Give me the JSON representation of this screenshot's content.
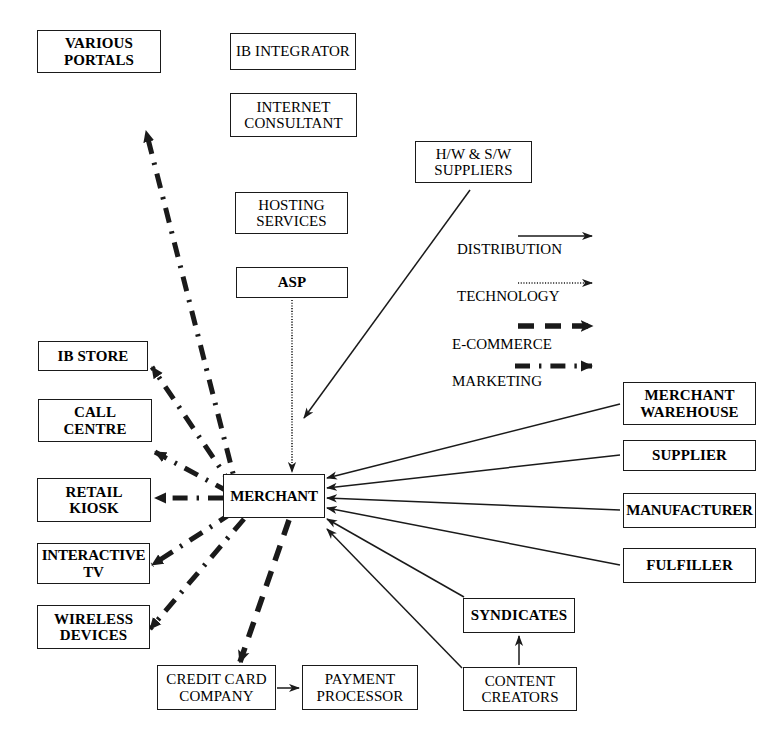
{
  "diagram": {
    "canvas": {
      "width": 782,
      "height": 738
    },
    "colors": {
      "line": "#1a1a1a",
      "box_border": "#1a1a1a",
      "background": "#ffffff",
      "text": "#000000"
    }
  },
  "nodes": [
    {
      "id": "various-portals",
      "label": "VARIOUS\nPORTALS",
      "x": 37,
      "y": 30,
      "w": 124,
      "h": 43,
      "bold": true
    },
    {
      "id": "ib-integrator",
      "label": "IB INTEGRATOR",
      "x": 230,
      "y": 33,
      "w": 126,
      "h": 37,
      "bold": false
    },
    {
      "id": "internet-consultant",
      "label": "INTERNET\nCONSULTANT",
      "x": 230,
      "y": 93,
      "w": 127,
      "h": 44,
      "bold": false
    },
    {
      "id": "hw-sw-suppliers",
      "label": "H/W & S/W\nSUPPLIERS",
      "x": 415,
      "y": 141,
      "w": 117,
      "h": 42,
      "bold": false
    },
    {
      "id": "hosting-services",
      "label": "HOSTING\nSERVICES",
      "x": 235,
      "y": 192,
      "w": 113,
      "h": 42,
      "bold": false
    },
    {
      "id": "asp",
      "label": "ASP",
      "x": 236,
      "y": 267,
      "w": 112,
      "h": 31,
      "bold": true
    },
    {
      "id": "ib-store",
      "label": "IB STORE",
      "x": 38,
      "y": 341,
      "w": 110,
      "h": 30,
      "bold": true
    },
    {
      "id": "call-centre",
      "label": "CALL\nCENTRE",
      "x": 38,
      "y": 399,
      "w": 114,
      "h": 43,
      "bold": true
    },
    {
      "id": "retail-kiosk",
      "label": "RETAIL\nKIOSK",
      "x": 37,
      "y": 478,
      "w": 114,
      "h": 44,
      "bold": true
    },
    {
      "id": "interactive-tv",
      "label": "INTERACTIVE\nTV",
      "x": 37,
      "y": 543,
      "w": 113,
      "h": 41,
      "bold": true
    },
    {
      "id": "wireless-devices",
      "label": "WIRELESS\nDEVICES",
      "x": 37,
      "y": 605,
      "w": 113,
      "h": 44,
      "bold": true
    },
    {
      "id": "merchant",
      "label": "MERCHANT",
      "x": 223,
      "y": 474,
      "w": 102,
      "h": 44,
      "bold": true
    },
    {
      "id": "merchant-warehouse",
      "label": "MERCHANT\nWAREHOUSE",
      "x": 623,
      "y": 382,
      "w": 133,
      "h": 43,
      "bold": true
    },
    {
      "id": "supplier",
      "label": "SUPPLIER",
      "x": 623,
      "y": 440,
      "w": 133,
      "h": 31,
      "bold": true
    },
    {
      "id": "manufacturer",
      "label": "MANUFACTURER",
      "x": 623,
      "y": 493,
      "w": 133,
      "h": 35,
      "bold": true
    },
    {
      "id": "fulfiller",
      "label": "FULFILLER",
      "x": 623,
      "y": 548,
      "w": 133,
      "h": 35,
      "bold": true
    },
    {
      "id": "syndicates",
      "label": "SYNDICATES",
      "x": 463,
      "y": 598,
      "w": 112,
      "h": 35,
      "bold": true
    },
    {
      "id": "content-creators",
      "label": "CONTENT\nCREATORS",
      "x": 463,
      "y": 667,
      "w": 114,
      "h": 44,
      "bold": false
    },
    {
      "id": "credit-card-company",
      "label": "CREDIT CARD\nCOMPANY",
      "x": 157,
      "y": 665,
      "w": 119,
      "h": 45,
      "bold": false
    },
    {
      "id": "payment-processor",
      "label": "PAYMENT\nPROCESSOR",
      "x": 302,
      "y": 665,
      "w": 116,
      "h": 45,
      "bold": false
    }
  ],
  "legend": {
    "items": [
      {
        "id": "distribution",
        "label": "DISTRIBUTION",
        "style": "solid",
        "label_x": 457,
        "label_y": 241,
        "arrow_x1": 518,
        "arrow_x2": 592,
        "arrow_y": 236
      },
      {
        "id": "technology",
        "label": "TECHNOLOGY",
        "style": "dotted",
        "label_x": 457,
        "label_y": 288,
        "arrow_x1": 518,
        "arrow_x2": 592,
        "arrow_y": 283
      },
      {
        "id": "e-commerce",
        "label": "E-COMMERCE",
        "style": "dashed",
        "label_x": 452,
        "label_y": 336,
        "arrow_x1": 518,
        "arrow_x2": 592,
        "arrow_y": 326
      },
      {
        "id": "marketing",
        "label": "MARKETING",
        "style": "dashdot",
        "label_x": 452,
        "label_y": 373,
        "arrow_x1": 515,
        "arrow_x2": 592,
        "arrow_y": 366
      }
    ]
  },
  "edges": [
    {
      "id": "merchant-to-various-portals",
      "from": "merchant",
      "to": "various-portals",
      "style": "dashdot",
      "x1": 239,
      "y1": 497,
      "x2": 146,
      "y2": 131
    },
    {
      "id": "merchant-to-ib-store",
      "from": "merchant",
      "to": "ib-store",
      "style": "dashdot",
      "x1": 233,
      "y1": 487,
      "x2": 152,
      "y2": 367
    },
    {
      "id": "merchant-to-call-centre",
      "from": "merchant",
      "to": "call-centre",
      "style": "dashdot",
      "x1": 229,
      "y1": 492,
      "x2": 155,
      "y2": 452
    },
    {
      "id": "merchant-to-retail-kiosk",
      "from": "merchant",
      "to": "retail-kiosk",
      "style": "dashdot",
      "x1": 223,
      "y1": 498,
      "x2": 155,
      "y2": 498
    },
    {
      "id": "merchant-to-interactive-tv",
      "from": "merchant",
      "to": "interactive-tv",
      "style": "dashdot",
      "x1": 232,
      "y1": 513,
      "x2": 152,
      "y2": 565
    },
    {
      "id": "merchant-to-wireless",
      "from": "merchant",
      "to": "wireless-devices",
      "style": "dashdot",
      "x1": 244,
      "y1": 519,
      "x2": 150,
      "y2": 629
    },
    {
      "id": "merchant-to-credit-card",
      "from": "merchant",
      "to": "credit-card-company",
      "style": "dashed",
      "x1": 289,
      "y1": 520,
      "x2": 240,
      "y2": 662
    },
    {
      "id": "asp-to-merchant",
      "from": "asp",
      "to": "merchant",
      "style": "dotted",
      "x1": 292,
      "y1": 300,
      "x2": 292,
      "y2": 472
    },
    {
      "id": "hw-sw-to-merchant",
      "from": "hw-sw-suppliers",
      "to": "merchant",
      "style": "solid",
      "x1": 470,
      "y1": 190,
      "x2": 304,
      "y2": 418
    },
    {
      "id": "merchant-warehouse-to-merchant",
      "from": "merchant-warehouse",
      "to": "merchant",
      "style": "solid",
      "x1": 620,
      "y1": 404,
      "x2": 327,
      "y2": 478
    },
    {
      "id": "supplier-to-merchant",
      "from": "supplier",
      "to": "merchant",
      "style": "solid",
      "x1": 620,
      "y1": 455,
      "x2": 327,
      "y2": 488
    },
    {
      "id": "manufacturer-to-merchant",
      "from": "manufacturer",
      "to": "merchant",
      "style": "solid",
      "x1": 620,
      "y1": 510,
      "x2": 327,
      "y2": 498
    },
    {
      "id": "fulfiller-to-merchant",
      "from": "fulfiller",
      "to": "merchant",
      "style": "solid",
      "x1": 620,
      "y1": 565,
      "x2": 327,
      "y2": 508
    },
    {
      "id": "syndicates-to-merchant",
      "from": "syndicates",
      "to": "merchant",
      "style": "solid",
      "x1": 464,
      "y1": 597,
      "x2": 327,
      "y2": 519
    },
    {
      "id": "content-creators-to-merchant",
      "from": "content-creators",
      "to": "merchant",
      "style": "solid",
      "x1": 462,
      "y1": 668,
      "x2": 327,
      "y2": 529
    },
    {
      "id": "content-creators-to-syndicates",
      "from": "content-creators",
      "to": "syndicates",
      "style": "solid",
      "x1": 519,
      "y1": 665,
      "x2": 519,
      "y2": 636
    },
    {
      "id": "credit-card-to-payment-processor",
      "from": "credit-card-company",
      "to": "payment-processor",
      "style": "solid",
      "x1": 277,
      "y1": 688,
      "x2": 299,
      "y2": 688
    }
  ]
}
